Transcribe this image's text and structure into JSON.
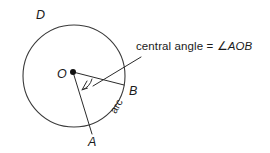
{
  "figure": {
    "background_color": "#ffffff",
    "stroke_color": "#2b2b2b",
    "callout": {
      "prefix": "central angle = ",
      "symbol": "∠",
      "points": "AOB",
      "full_text": "central angle = ∠AOB"
    },
    "labels": {
      "circle_point_d": "D",
      "center_o": "O",
      "point_a": "A",
      "point_b": "B",
      "arc": "arc"
    },
    "geometry": {
      "circle_center_x": 74,
      "circle_center_y": 76,
      "circle_radius": 51,
      "center_dot_x": 73,
      "center_dot_y": 72,
      "point_a_x": 92,
      "point_a_y": 135,
      "point_b_x": 124,
      "point_b_y": 85,
      "leader_start_x": 141,
      "leader_start_y": 56,
      "leader_end_x": 92,
      "leader_end_y": 86
    }
  }
}
